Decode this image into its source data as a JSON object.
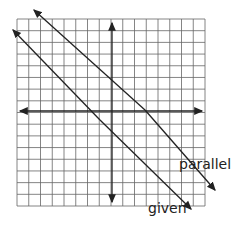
{
  "diagram": {
    "type": "coordinate-grid-parallel-lines",
    "grid": {
      "cols": 16,
      "rows": 16
    },
    "lines": [
      {
        "name": "parallel",
        "label": "parallel"
      },
      {
        "name": "given",
        "label": "given"
      }
    ],
    "colors": {
      "grid": "#555555",
      "axis": "#222222",
      "line": "#222222",
      "background": "#ffffff"
    }
  }
}
